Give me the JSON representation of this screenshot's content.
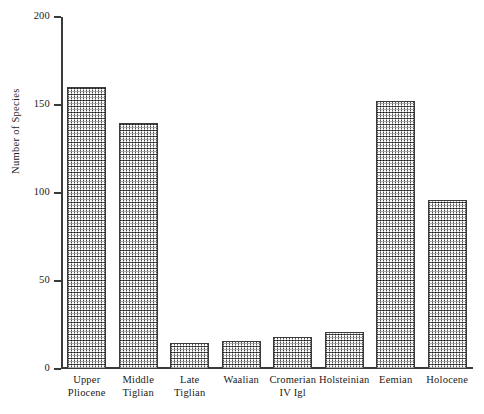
{
  "chart_data": {
    "type": "bar",
    "title": "",
    "subtitle": "",
    "xlabel": "",
    "ylabel": "Number of Species",
    "ylim": [
      0,
      200
    ],
    "yticks": [
      0,
      50,
      100,
      150,
      200
    ],
    "ytick_labels": [
      "0",
      "50",
      "100",
      "150",
      "200"
    ],
    "grid": false,
    "legend": null,
    "categories": [
      "Upper Pliocene",
      "Middle Tiglian",
      "Late Tiglian",
      "Waalian",
      "Cromerian IV Igl",
      "Holsteinian",
      "Eemian",
      "Holocene"
    ],
    "category_lines": [
      [
        "Upper",
        "Pliocene"
      ],
      [
        "Middle",
        "Tiglian"
      ],
      [
        "Late",
        "Tiglian"
      ],
      [
        "Waalian",
        ""
      ],
      [
        "Cromerian",
        "IV Igl"
      ],
      [
        "Holsteinian",
        ""
      ],
      [
        "Eemian",
        ""
      ],
      [
        "Holocene",
        ""
      ]
    ],
    "values": [
      160,
      140,
      15,
      16,
      18,
      21,
      152,
      96
    ],
    "bar_fill": "#ffffff",
    "bar_pattern": "fine-dotted-halftone",
    "bar_edge_color": "#3b3b3b",
    "axis_color": "#3a3a3a",
    "background": "#ffffff"
  }
}
